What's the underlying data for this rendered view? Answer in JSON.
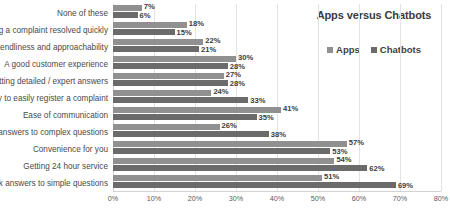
{
  "chart_data": {
    "type": "bar",
    "orientation": "horizontal",
    "title": "Apps versus Chatbots",
    "xlabel": "",
    "ylabel": "",
    "xlim": [
      0,
      80
    ],
    "grid": true,
    "legend_position": "top-right",
    "xticks": [
      "0%",
      "10%",
      "20%",
      "30%",
      "40%",
      "50%",
      "60%",
      "70%",
      "80%"
    ],
    "xtick_values": [
      0,
      10,
      20,
      30,
      40,
      50,
      60,
      70,
      80
    ],
    "categories": [
      "None of these",
      "Having a complaint resolved quickly",
      "Friendliness and approachability",
      "A good customer experience",
      "Getting detailed / expert answers",
      "Ability to easily register a complaint",
      "Ease of communication",
      "Quick answers to complex questions",
      "Convenience for you",
      "Getting 24 hour service",
      "Quick answers to simple questions"
    ],
    "series": [
      {
        "name": "Apps",
        "color": "#909090",
        "values": [
          7,
          18,
          22,
          30,
          27,
          24,
          41,
          26,
          57,
          54,
          51
        ],
        "labels": [
          "7%",
          "18%",
          "22%",
          "30%",
          "27%",
          "24%",
          "41%",
          "26%",
          "57%",
          "54%",
          "51%"
        ]
      },
      {
        "name": "Chatbots",
        "color": "#6b6b6b",
        "values": [
          6,
          15,
          21,
          28,
          28,
          33,
          35,
          38,
          53,
          62,
          69
        ],
        "labels": [
          "6%",
          "15%",
          "21%",
          "28%",
          "28%",
          "33%",
          "35%",
          "38%",
          "53%",
          "62%",
          "69%"
        ]
      }
    ]
  }
}
